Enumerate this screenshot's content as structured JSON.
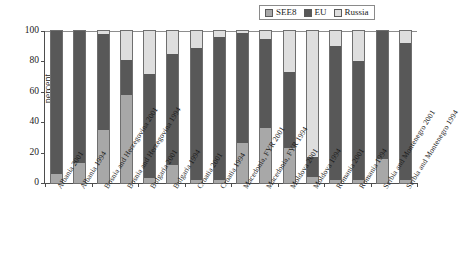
{
  "chart_data": {
    "type": "bar",
    "subtype": "stacked-bar-100-percent",
    "title": "",
    "xlabel": "",
    "ylabel": "percent",
    "ylim": [
      0,
      100
    ],
    "yticks": [
      0,
      20,
      40,
      60,
      80,
      100
    ],
    "grid": false,
    "legend_position": "top-right",
    "categories": [
      "Albania 2001",
      "Albania 1994",
      "Bosnia and Herzegovina 2001",
      "Bosnia and Herzegovina 1994",
      "Bulgaria 2001",
      "Bulgaria 1994",
      "Croatia 2001",
      "Croatia 1994",
      "Macedonia, FYR 2001",
      "Macedonia, FYR 1994",
      "Moldova 2001",
      "Moldova 1994",
      "Romania 2001",
      "Romania 1994",
      "Serbia and Montenegro 2001",
      "Serbia and Montenegro 1994"
    ],
    "series": [
      {
        "name": "SEE8",
        "color": "#a8a8a8",
        "values": [
          6,
          13,
          35,
          58,
          3,
          12,
          2,
          2,
          26,
          36,
          23,
          4,
          2,
          2,
          16,
          2
        ]
      },
      {
        "name": "EU",
        "color": "#585858",
        "values": [
          94,
          87,
          63,
          23,
          69,
          73,
          87,
          94,
          73,
          59,
          50,
          13,
          88,
          78,
          84,
          90
        ]
      },
      {
        "name": "Russia",
        "color": "#dedede",
        "values": [
          0,
          0,
          2,
          19,
          28,
          15,
          11,
          4,
          1,
          5,
          27,
          83,
          10,
          20,
          0,
          8
        ]
      }
    ]
  },
  "legend": {
    "entries": [
      {
        "label": "SEE8"
      },
      {
        "label": "EU"
      },
      {
        "label": "Russia"
      }
    ]
  }
}
